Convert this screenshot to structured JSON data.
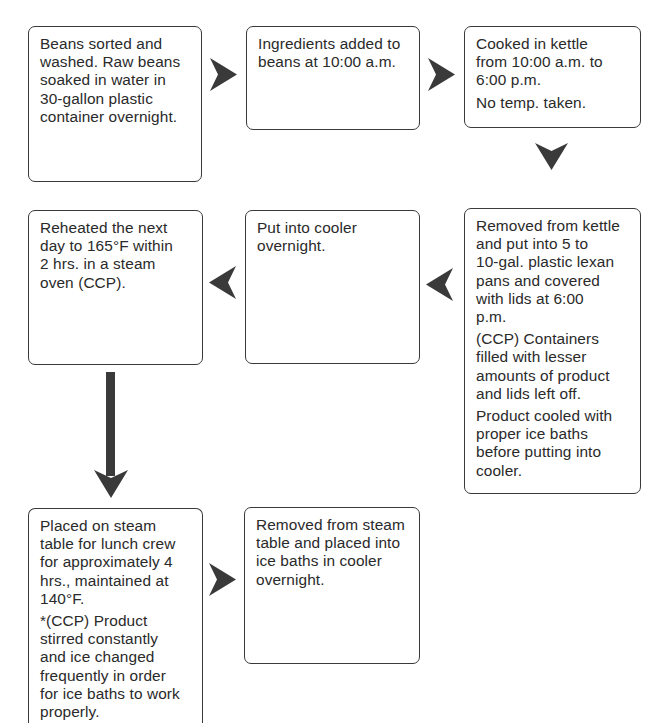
{
  "diagram": {
    "type": "process-flowchart",
    "arrow_color": "#3a3a3a",
    "border_color": "#3a3a3a",
    "steps": [
      {
        "id": "step-1",
        "paragraphs": [
          "Beans sorted and\nwashed. Raw beans\nsoaked in water in\n30-gallon plastic\ncontainer overnight."
        ]
      },
      {
        "id": "step-2",
        "paragraphs": [
          "Ingredients added to\nbeans at 10:00 a.m."
        ]
      },
      {
        "id": "step-3",
        "paragraphs": [
          "Cooked in kettle\nfrom 10:00 a.m. to\n6:00 p.m.",
          "No temp. taken."
        ]
      },
      {
        "id": "step-4",
        "paragraphs": [
          "Removed from kettle\nand put into 5 to\n10-gal. plastic lexan\npans and covered\nwith lids at 6:00\np.m.",
          "(CCP) Containers\nfilled with lesser\namounts of product\nand lids left off.",
          "Product cooled with\nproper ice baths\nbefore putting into\ncooler."
        ]
      },
      {
        "id": "step-5",
        "paragraphs": [
          "Put into cooler\novernight."
        ]
      },
      {
        "id": "step-6",
        "paragraphs": [
          "Reheated the next\nday to 165°F within\n2 hrs. in a steam\noven (CCP)."
        ]
      },
      {
        "id": "step-7",
        "paragraphs": [
          "Placed on steam\ntable for lunch crew\nfor approximately 4\nhrs., maintained at\n140°F.",
          "*(CCP) Product\nstirred constantly\nand ice changed\nfrequently in order\nfor ice baths to work\nproperly."
        ]
      },
      {
        "id": "step-8",
        "paragraphs": [
          "Removed from steam\ntable and placed into\nice baths in cooler\novernight."
        ]
      }
    ],
    "connectors": [
      {
        "from": "step-1",
        "to": "step-2",
        "direction": "right"
      },
      {
        "from": "step-2",
        "to": "step-3",
        "direction": "right"
      },
      {
        "from": "step-3",
        "to": "step-4",
        "direction": "down"
      },
      {
        "from": "step-4",
        "to": "step-5",
        "direction": "left"
      },
      {
        "from": "step-5",
        "to": "step-6",
        "direction": "left"
      },
      {
        "from": "step-6",
        "to": "step-7",
        "direction": "down"
      },
      {
        "from": "step-7",
        "to": "step-8",
        "direction": "right"
      }
    ]
  }
}
